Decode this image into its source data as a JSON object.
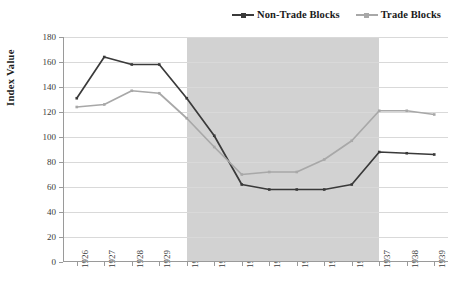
{
  "chart_data": {
    "type": "line",
    "title": "",
    "xlabel": "",
    "ylabel": "Index Value",
    "x": [
      "1926",
      "1927",
      "1928",
      "1929",
      "1930",
      "1931",
      "1932",
      "1933",
      "1934",
      "1935",
      "1936",
      "1937",
      "1938",
      "1939"
    ],
    "categories": [
      "1926",
      "1927",
      "1928",
      "1929",
      "1930",
      "1931",
      "1932",
      "1933",
      "1934",
      "1935",
      "1936",
      "1937",
      "1938",
      "1939"
    ],
    "ylim": [
      0,
      180
    ],
    "ytick_step": 20,
    "yticks": [
      0,
      20,
      40,
      60,
      80,
      100,
      120,
      140,
      160,
      180
    ],
    "grid": true,
    "legend_position": "top-right",
    "shaded_region": {
      "label": "",
      "x_start": "1930",
      "x_end": "1937",
      "color": "#d2d2d2"
    },
    "series": [
      {
        "name": "Non-Trade Blocks",
        "color": "#3a3a3a",
        "marker": "square",
        "values": [
          131,
          164,
          158,
          158,
          131,
          101,
          62,
          58,
          58,
          58,
          62,
          88,
          87,
          86
        ]
      },
      {
        "name": "Trade Blocks",
        "color": "#a8a8a8",
        "marker": "square",
        "values": [
          124,
          126,
          137,
          135,
          115,
          92,
          70,
          72,
          72,
          82,
          97,
          121,
          121,
          118
        ]
      }
    ]
  },
  "legend": {
    "entries": [
      {
        "label": "Non-Trade Blocks",
        "color": "#3a3a3a"
      },
      {
        "label": "Trade Blocks",
        "color": "#a8a8a8"
      }
    ]
  },
  "axes": {
    "y_title": "Index Value",
    "y_ticks": [
      "180",
      "160",
      "140",
      "120",
      "100",
      "80",
      "60",
      "40",
      "20",
      "0"
    ],
    "x_ticks": [
      "1926",
      "1927",
      "1928",
      "1929",
      "1930",
      "1931",
      "1932",
      "1933",
      "1934",
      "1935",
      "1936",
      "1937",
      "1938",
      "1939"
    ]
  },
  "colors": {
    "series_dark": "#3a3a3a",
    "series_light": "#a8a8a8",
    "shade": "#d2d2d2",
    "grid": "#d9d9d9",
    "axis": "#9a9a9a",
    "text": "#1a1a1a"
  }
}
